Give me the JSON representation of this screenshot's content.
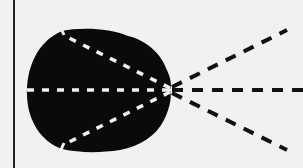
{
  "diagram": {
    "colors": {
      "background": "#f1f1f1",
      "blob": "#0a0a0a",
      "inner_dashes": "#f1f1f1",
      "outer_dashes": "#111111",
      "boundary_line": "#222222"
    },
    "focal_point": {
      "x": 170,
      "y": 90
    },
    "boundary_line": {
      "x": 14,
      "y1": 0,
      "y2": 168
    },
    "rays": [
      {
        "name": "upper",
        "inside_end": {
          "x": 62,
          "y": 33
        },
        "outside_end": {
          "x": 287,
          "y": 30
        }
      },
      {
        "name": "center",
        "inside_end": {
          "x": 27,
          "y": 90
        },
        "outside_end": {
          "x": 303,
          "y": 90
        }
      },
      {
        "name": "lower",
        "inside_end": {
          "x": 62,
          "y": 147
        },
        "outside_end": {
          "x": 287,
          "y": 150
        }
      }
    ]
  }
}
